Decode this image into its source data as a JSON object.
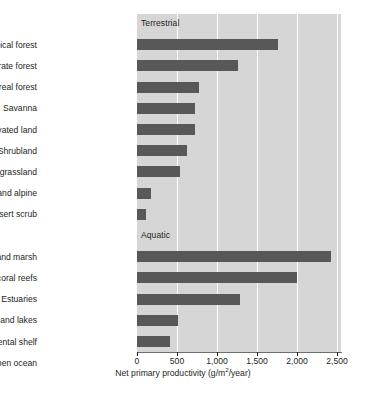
{
  "chart_data": {
    "type": "bar",
    "orientation": "horizontal",
    "title": "",
    "xlabel": "Net primary productivity (g/m2/year)",
    "xlabel_display": "Net primary productivity (g/m²/year)",
    "ylabel": "",
    "xlim": [
      0,
      2500
    ],
    "xticks": [
      0,
      500,
      1000,
      1500,
      2000,
      2500
    ],
    "xticklabels": [
      "0",
      "500",
      "1,000",
      "1,500",
      "2,000",
      "2,500"
    ],
    "grid": true,
    "grid_axis": "x",
    "legend": "none",
    "plot_background_color": "#d6d6d6",
    "bar_color": "#585858",
    "gridline_color": "#ffffff",
    "group_labels": [
      "Terrestrial",
      "Aquatic"
    ],
    "groups": [
      {
        "name": "Terrestrial",
        "categories": [
          "Tropical forest",
          "Temperate forest",
          "Boreal forest",
          "Savanna",
          "Cultivated land",
          "Shrubland",
          "Temperate grassland",
          "Tundra and alpine",
          "Desert scrub"
        ],
        "values": [
          1760,
          1260,
          775,
          725,
          725,
          625,
          540,
          175,
          115
        ]
      },
      {
        "name": "Aquatic",
        "categories": [
          "Swamp and marsh",
          "Algal beds and coral reefs",
          "Estuaries",
          "Rivers and lakes",
          "Continental shelf",
          "Open ocean"
        ],
        "values": [
          2425,
          2000,
          1285,
          510,
          410,
          135
        ]
      }
    ],
    "categories": [
      "Tropical forest",
      "Temperate forest",
      "Boreal forest",
      "Savanna",
      "Cultivated land",
      "Shrubland",
      "Temperate grassland",
      "Tundra and alpine",
      "Desert scrub",
      "Swamp and marsh",
      "Algal beds and coral reefs",
      "Estuaries",
      "Rivers and lakes",
      "Continental shelf",
      "Open ocean"
    ],
    "values": [
      1760,
      1260,
      775,
      725,
      725,
      625,
      540,
      175,
      115,
      2425,
      2000,
      1285,
      510,
      410,
      135
    ]
  },
  "caption": ""
}
